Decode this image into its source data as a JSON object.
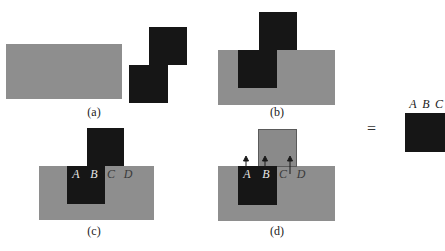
{
  "panels": {
    "a": {
      "caption": "(a)"
    },
    "b": {
      "caption": "(b)"
    },
    "c": {
      "caption": "(c)",
      "labels": [
        "A",
        "B",
        "C",
        "D"
      ]
    },
    "d": {
      "caption": "(d)",
      "labels": [
        "A",
        "B",
        "C",
        "D"
      ]
    }
  },
  "result": {
    "equals": "=",
    "labels": [
      "A",
      "B",
      "C"
    ]
  },
  "colors": {
    "gray": "#8e8e8e",
    "black": "#161616"
  }
}
